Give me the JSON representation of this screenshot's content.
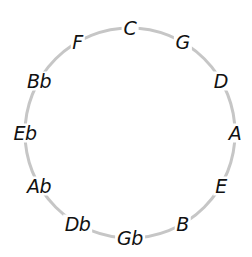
{
  "diagram": {
    "center": [
      130,
      133
    ],
    "radius": 105,
    "ring_color": "#c6c6c6",
    "label_color": "#111111",
    "notes": [
      {
        "label": "C",
        "angle_deg": 0
      },
      {
        "label": "G",
        "angle_deg": 30
      },
      {
        "label": "D",
        "angle_deg": 60
      },
      {
        "label": "A",
        "angle_deg": 90
      },
      {
        "label": "E",
        "angle_deg": 120
      },
      {
        "label": "B",
        "angle_deg": 150
      },
      {
        "label": "Gb",
        "angle_deg": 180
      },
      {
        "label": "Db",
        "angle_deg": 210
      },
      {
        "label": "Ab",
        "angle_deg": 240
      },
      {
        "label": "Eb",
        "angle_deg": 270
      },
      {
        "label": "Bb",
        "angle_deg": 300
      },
      {
        "label": "F",
        "angle_deg": 330
      }
    ]
  }
}
